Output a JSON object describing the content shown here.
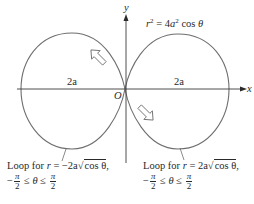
{
  "figure": {
    "type": "polar-curve-lemniscate",
    "equation": {
      "lhs_var": "r",
      "lhs_exp": "2",
      "equals": "=",
      "rhs_coef": "4",
      "rhs_var": "a",
      "rhs_exp": "2",
      "rhs_func": "cos",
      "rhs_arg": "θ"
    },
    "axes": {
      "x_label": "x",
      "y_label": "y",
      "origin_label": "O"
    },
    "width_labels": {
      "left": "2a",
      "right": "2a"
    },
    "captions": {
      "left": {
        "prefix": "Loop for ",
        "var": "r",
        "equals": " = ",
        "coef": "−2a",
        "sqrt_body": "cos  θ",
        "suffix": ",",
        "range_minus": "−",
        "pi": "π",
        "two": "2",
        "leq1": " ≤ ",
        "theta": "θ",
        "leq2": " ≤ "
      },
      "right": {
        "prefix": "Loop for ",
        "var": "r",
        "equals": " = ",
        "coef": "2a",
        "sqrt_body": "cos  θ",
        "suffix": ",",
        "range_minus": "−",
        "pi": "π",
        "two": "2",
        "leq1": " ≤ ",
        "theta": "θ",
        "leq2": " ≤ "
      }
    },
    "arrows": {
      "left_loop": "direction-arrow-up-left",
      "right_loop": "direction-arrow-down-right"
    },
    "colors": {
      "curve": "#6e6e6e",
      "axis": "#3a3a3a",
      "text": "#2a2a2a",
      "background": "#ffffff"
    }
  }
}
